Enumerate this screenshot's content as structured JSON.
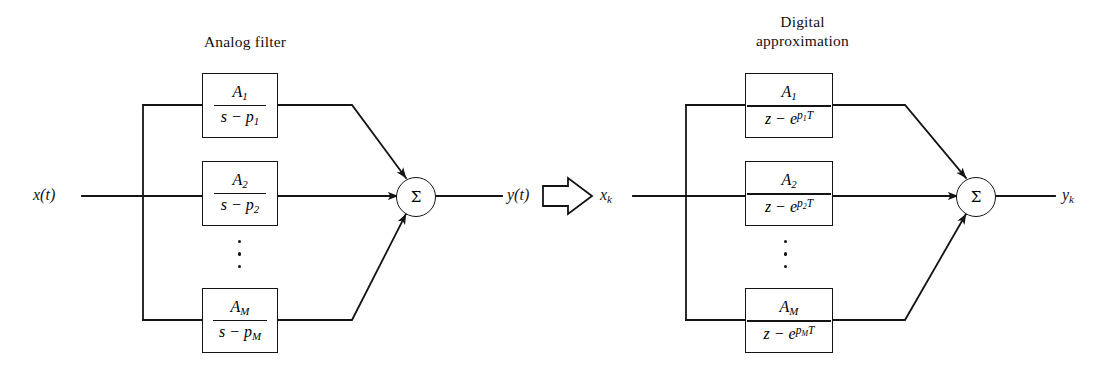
{
  "figure": {
    "type": "signal-flow block diagram"
  },
  "sections": [
    {
      "id": "analog",
      "caption": "Analog filter",
      "input_label": "x(t)",
      "output_label": "y(t)",
      "sum_symbol": "Σ",
      "ellipsis_dots": 3,
      "branches": [
        {
          "numerator": "A1",
          "denominator": "s - p1"
        },
        {
          "numerator": "A2",
          "denominator": "s - p2"
        },
        {
          "numerator": "AM",
          "denominator": "s - pM"
        }
      ]
    },
    {
      "id": "digital",
      "caption": "Digital\napproximation",
      "input_label": "xk",
      "output_label": "yk",
      "sum_symbol": "Σ",
      "ellipsis_dots": 3,
      "branches": [
        {
          "numerator": "A1",
          "denominator": "z - e^(p1 T)"
        },
        {
          "numerator": "A2",
          "denominator": "z - e^(p2 T)"
        },
        {
          "numerator": "AM",
          "denominator": "z - e^(pM T)"
        }
      ]
    }
  ],
  "transition": {
    "glyph": "block-arrow-right",
    "meaning": "maps to"
  },
  "colors": {
    "line": "#141414",
    "text": "#121212",
    "background": "#ffffff"
  }
}
